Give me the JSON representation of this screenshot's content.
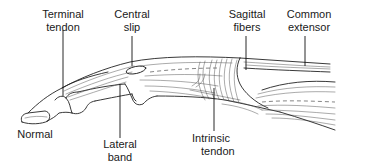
{
  "figure": {
    "type": "anatomical line drawing",
    "stroke_color": "#222222",
    "background": "#ffffff"
  },
  "labels": {
    "terminal_tendon": {
      "line1": "Terminal",
      "line2": "tendon"
    },
    "central_slip": {
      "line1": "Central",
      "line2": "slip"
    },
    "sagittal_fibers": {
      "line1": "Sagittal",
      "line2": "fibers"
    },
    "common_extensor": {
      "line1": "Common",
      "line2": "extensor"
    },
    "normal": {
      "line1": "Normal"
    },
    "lateral_band": {
      "line1": "Lateral",
      "line2": "band"
    },
    "intrinsic_tendon": {
      "line1": "Intrinsic",
      "line2": "tendon"
    }
  }
}
